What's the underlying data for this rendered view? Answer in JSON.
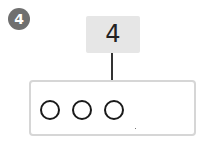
{
  "problem": {
    "number": "4",
    "target_value": "4",
    "circles_drawn": 3,
    "circles": [
      {
        "id": 1,
        "left": 9
      },
      {
        "id": 2,
        "left": 41
      },
      {
        "id": 3,
        "left": 73
      }
    ]
  },
  "colors": {
    "badge": "#6f6f6f",
    "number_box": "#e6e6e6",
    "tray_border": "#d6d6d6",
    "circle_stroke": "#1a1a1a"
  }
}
